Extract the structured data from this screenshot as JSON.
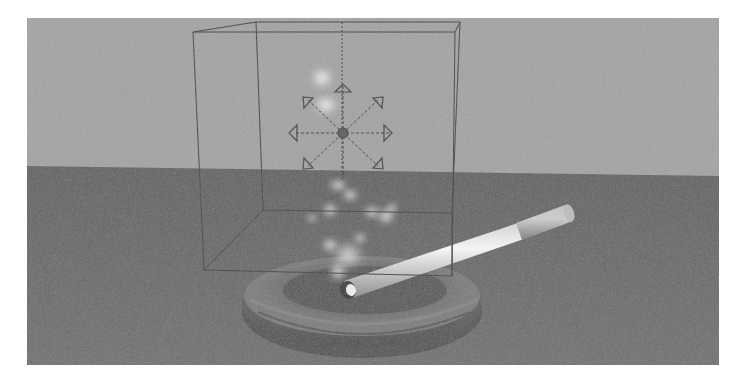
{
  "viewport": {
    "name": "3D perspective viewport",
    "caption": "Smoke particle emitter over cigarette in ashtray",
    "colors": {
      "sky": "#9e9e9e",
      "ground": "#6b6b6b",
      "wireframe": "#3a3a3a",
      "ashtray_dark": "#4c4c4c",
      "ashtray_light": "#8a8a8a",
      "cigarette": "#e6e6e6",
      "filter": "#b5b5b5",
      "smoke": "#f2f2f2"
    }
  },
  "scene": {
    "objects": [
      {
        "id": "emitter-bounding-box",
        "label": "Particle emitter volume"
      },
      {
        "id": "move-manipulator",
        "label": "Move manipulator"
      },
      {
        "id": "smoke-particles",
        "label": "Smoke particles"
      },
      {
        "id": "cigarette",
        "label": "Cigarette"
      },
      {
        "id": "ashtray",
        "label": "Ashtray"
      },
      {
        "id": "ground-plane",
        "label": "Ground plane"
      }
    ]
  }
}
